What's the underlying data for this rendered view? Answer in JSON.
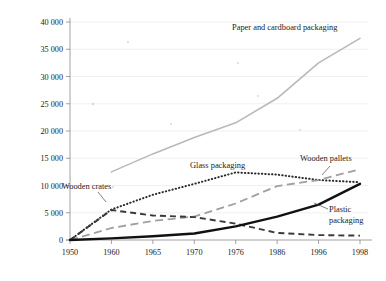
{
  "chart_data": {
    "type": "line",
    "title": "",
    "xlabel": "",
    "ylabel": "",
    "ylim": [
      0,
      40000
    ],
    "grid": true,
    "legend_position": "inline-labels",
    "categories": [
      "1950",
      "1960",
      "1965",
      "1970",
      "1976",
      "1986",
      "1996",
      "1998"
    ],
    "ytick_labels": [
      "0",
      "5 000",
      "10 000",
      "15 000",
      "20 000",
      "25 000",
      "30 000",
      "35 000",
      "40 000"
    ],
    "ytick_values": [
      0,
      5000,
      10000,
      15000,
      20000,
      25000,
      30000,
      35000,
      40000
    ],
    "series": [
      {
        "name": "Paper and cardboard packaging",
        "style": "solid-light",
        "color": "#b9b9b9",
        "x": [
          "1960",
          "1965",
          "1970",
          "1976",
          "1986",
          "1996",
          "1998"
        ],
        "values": [
          12500,
          15800,
          18800,
          21500,
          26000,
          32500,
          37000
        ]
      },
      {
        "name": "Glass packaging",
        "style": "dotted",
        "color": "#2a2a2a",
        "x": [
          "1950",
          "1960",
          "1965",
          "1970",
          "1976",
          "1986",
          "1996",
          "1998"
        ],
        "values": [
          0,
          5600,
          8300,
          10300,
          12400,
          12000,
          11000,
          10600
        ]
      },
      {
        "name": "Wooden pallets",
        "style": "long-dash",
        "color": "#a0a0a0",
        "x": [
          "1950",
          "1960",
          "1965",
          "1970",
          "1976",
          "1986",
          "1996",
          "1998"
        ],
        "values": [
          0,
          2200,
          3500,
          4300,
          6700,
          9900,
          11000,
          13000
        ]
      },
      {
        "name": "Wooden crates",
        "style": "dash",
        "color": "#3a3a3a",
        "x": [
          "1950",
          "1960",
          "1965",
          "1970",
          "1976",
          "1986",
          "1996",
          "1998"
        ],
        "values": [
          0,
          5500,
          4500,
          4200,
          3000,
          1300,
          900,
          800
        ]
      },
      {
        "name": "Plastic packaging",
        "style": "solid-heavy",
        "color": "#111111",
        "x": [
          "1950",
          "1960",
          "1965",
          "1970",
          "1976",
          "1986",
          "1996",
          "1998"
        ],
        "values": [
          0,
          300,
          700,
          1200,
          2500,
          4300,
          6500,
          10300
        ]
      }
    ],
    "annotations": [
      {
        "text": "Paper and cardboard packaging",
        "x": 232,
        "y": 30,
        "anchor": "start"
      },
      {
        "text": "Glass packaging",
        "x": 190,
        "y": 168,
        "anchor": "start"
      },
      {
        "text": "Wooden pallets",
        "x": 300,
        "y": 161,
        "anchor": "start"
      },
      {
        "text": "Wooden crates",
        "x": 62,
        "y": 189,
        "anchor": "start"
      },
      {
        "text": "Plastic",
        "x": 329,
        "y": 212,
        "anchor": "start"
      },
      {
        "text": "packaging",
        "x": 329,
        "y": 223,
        "anchor": "start"
      }
    ]
  }
}
